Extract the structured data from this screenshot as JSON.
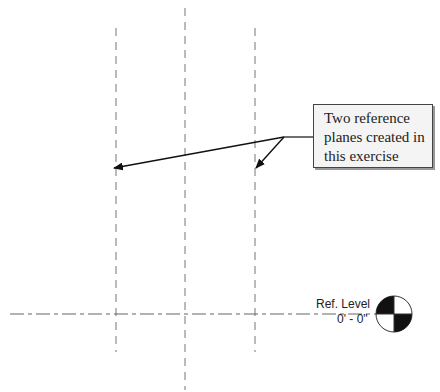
{
  "diagram": {
    "callout": {
      "lines": [
        "Two reference",
        "planes created in",
        "this exercise"
      ]
    },
    "level": {
      "name": "Ref. Level",
      "elevation": "0' - 0\""
    },
    "colors": {
      "line": "#666666",
      "text": "#222222",
      "callout_bg": "#f4f4f4"
    },
    "reference_planes": [
      {
        "name": "left-reference-plane",
        "x": 116
      },
      {
        "name": "center-reference-plane",
        "x": 185
      },
      {
        "name": "right-reference-plane",
        "x": 255
      }
    ]
  }
}
